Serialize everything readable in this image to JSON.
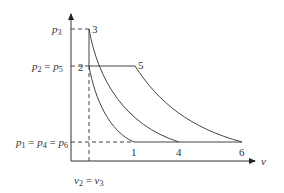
{
  "diagram": {
    "type": "p-v diagram",
    "axes": {
      "x_label": "v",
      "y_label": ""
    },
    "pressure_labels": {
      "p3": "p3",
      "p2_p5": "p2 = p5",
      "p1_p4_p6": "p1 = p4 = p6"
    },
    "volume_labels": {
      "v2_v3": "v2 = v3"
    },
    "points": [
      {
        "id": "1",
        "label": "1"
      },
      {
        "id": "2",
        "label": "2"
      },
      {
        "id": "3",
        "label": "3"
      },
      {
        "id": "4",
        "label": "4"
      },
      {
        "id": "5",
        "label": "5"
      },
      {
        "id": "6",
        "label": "6"
      }
    ],
    "curves": [
      {
        "from": "2",
        "to": "1"
      },
      {
        "from": "3",
        "to": "4"
      },
      {
        "from": "5",
        "to": "6"
      }
    ],
    "colors": {
      "line": "#444444",
      "text": "#333333"
    }
  }
}
